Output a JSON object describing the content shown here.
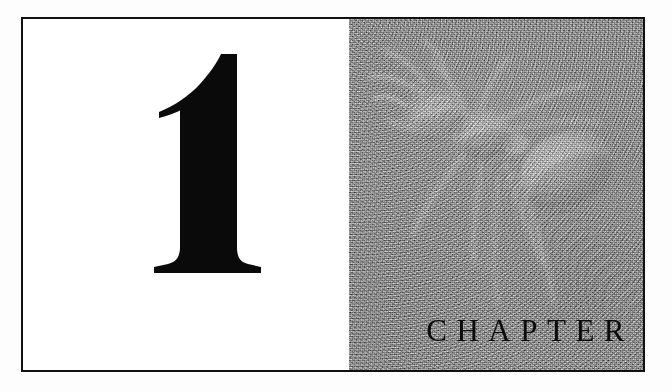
{
  "page": {
    "background_color": "#fdfdfd",
    "width": 672,
    "height": 392
  },
  "plate": {
    "border_color": "#111111",
    "label": "chapter-opening-plate"
  },
  "numeral_panel": {
    "background_color": "#ffffff",
    "chapter_number": "1",
    "numeral_color": "#0a0a0a"
  },
  "photo_panel": {
    "background_color": "#8d8d8d",
    "caption": "ant",
    "subject_color": "#d9d9d9",
    "icon_name": "ant-illustration"
  },
  "chapter_label": {
    "text": "CHAPTER",
    "color": "#0b0b0b"
  }
}
